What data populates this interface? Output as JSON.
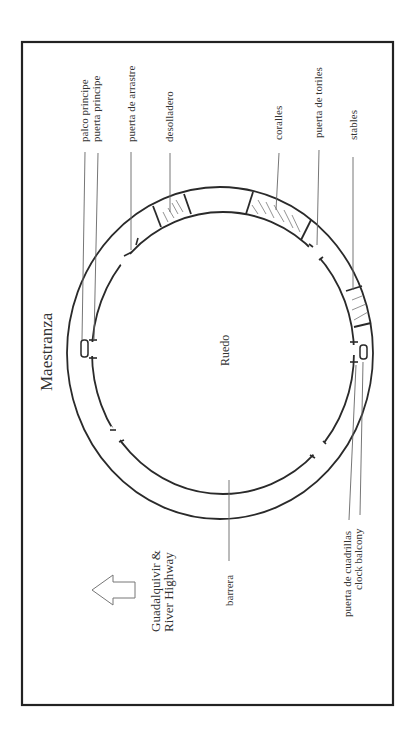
{
  "diagram": {
    "title": "Maestranza",
    "center_label": "Ruedo",
    "direction": {
      "line1": "Guadalquivir &",
      "line2": "River Highway",
      "icon": "arrow-left-icon"
    },
    "labels_top": [
      {
        "id": "palco-principe",
        "text": "palco principe"
      },
      {
        "id": "puerta-principe",
        "text": "puerta principe"
      },
      {
        "id": "puerta-de-arrastre",
        "text": "puerta de arrastre"
      },
      {
        "id": "desolladero",
        "text": "desolladero"
      },
      {
        "id": "coralles",
        "text": "coralles"
      },
      {
        "id": "puerta-de-toriles",
        "text": "puerta de toriles"
      },
      {
        "id": "stables",
        "text": "stables"
      }
    ],
    "labels_bottom": [
      {
        "id": "barrera",
        "text": "barrera"
      },
      {
        "id": "puerta-de-cuadrillas",
        "text": "puerta de cuadrillas"
      },
      {
        "id": "clock-balcony",
        "text": "clock balcony"
      }
    ],
    "colors": {
      "frame": "#222222",
      "stroke": "#2a2a2a",
      "leader": "#666666",
      "hatch": "#777777",
      "text": "#333333"
    }
  }
}
